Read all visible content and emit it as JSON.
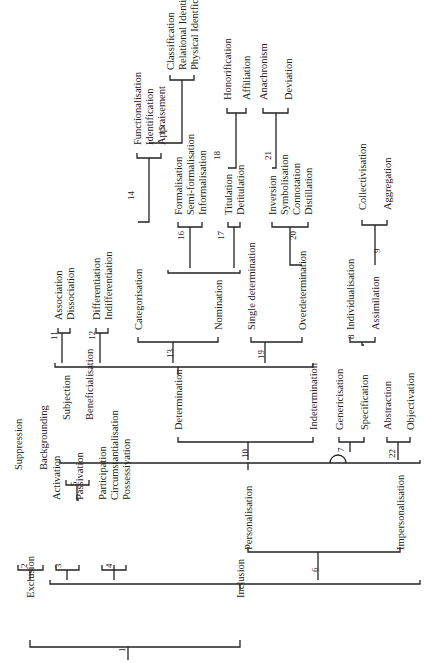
{
  "diagram": {
    "orientation": "rotated-90-ccw",
    "labels": [
      {
        "id": "exclusion",
        "text": "Exclusion",
        "x": 30,
        "y": 598
      },
      {
        "id": "inclusion",
        "text": "Inclusion",
        "x": 240,
        "y": 598
      },
      {
        "id": "suppression",
        "text": "Suppression",
        "x": 18,
        "y": 470
      },
      {
        "id": "backgrounding",
        "text": "Backgrounding",
        "x": 43,
        "y": 470
      },
      {
        "id": "activation",
        "text": "Activation",
        "x": 56,
        "y": 500
      },
      {
        "id": "passivation",
        "text": "Passivation",
        "x": 79,
        "y": 500
      },
      {
        "id": "subjection",
        "text": "Subjection",
        "x": 66,
        "y": 420
      },
      {
        "id": "beneficialisation",
        "text": "Beneficialisation",
        "x": 89,
        "y": 420
      },
      {
        "id": "participation",
        "text": "Participation",
        "x": 102,
        "y": 500
      },
      {
        "id": "circumstantialisation",
        "text": "Circumstantialisation",
        "x": 114,
        "y": 500
      },
      {
        "id": "possessivation",
        "text": "Possessivation",
        "x": 126,
        "y": 500
      },
      {
        "id": "personalisation",
        "text": "Personalisation",
        "x": 248,
        "y": 550
      },
      {
        "id": "impersonalisation",
        "text": "Impersonalisation",
        "x": 400,
        "y": 550
      },
      {
        "id": "determination",
        "text": "Determination",
        "x": 178,
        "y": 430
      },
      {
        "id": "indetermination",
        "text": "Indetermination",
        "x": 313,
        "y": 430
      },
      {
        "id": "genericisation",
        "text": "Genericisation",
        "x": 339,
        "y": 430
      },
      {
        "id": "specification",
        "text": "Specification",
        "x": 364,
        "y": 430
      },
      {
        "id": "abstraction",
        "text": "Abstraction",
        "x": 387,
        "y": 430
      },
      {
        "id": "objectivation",
        "text": "Objectivation",
        "x": 410,
        "y": 430
      },
      {
        "id": "association",
        "text": "Association",
        "x": 58,
        "y": 320
      },
      {
        "id": "dissociation",
        "text": "Dissociation",
        "x": 70,
        "y": 320
      },
      {
        "id": "differentiation",
        "text": "Differentiation",
        "x": 96,
        "y": 320
      },
      {
        "id": "indifferentiation",
        "text": "Indifferentiation",
        "x": 108,
        "y": 320
      },
      {
        "id": "categorisation",
        "text": "Categorisation",
        "x": 138,
        "y": 330
      },
      {
        "id": "nomination",
        "text": "Nomination",
        "x": 218,
        "y": 330
      },
      {
        "id": "single-determination",
        "text": "Single determination",
        "x": 251,
        "y": 330
      },
      {
        "id": "overdetermination",
        "text": "Overdetermination",
        "x": 302,
        "y": 330
      },
      {
        "id": "functionalisation",
        "text": "Functionalisation",
        "x": 137,
        "y": 145
      },
      {
        "id": "identification",
        "text": "Identification",
        "x": 149,
        "y": 145
      },
      {
        "id": "appraisement",
        "text": "Appraisement",
        "x": 161,
        "y": 145
      },
      {
        "id": "classification",
        "text": "Classification",
        "x": 170,
        "y": 70
      },
      {
        "id": "relational-identification",
        "text": "Relational Identification",
        "x": 182,
        "y": 70
      },
      {
        "id": "physical-identification",
        "text": "Physical Identfication",
        "x": 194,
        "y": 70
      },
      {
        "id": "formalisation",
        "text": "Formalisation",
        "x": 178,
        "y": 215
      },
      {
        "id": "semi-formalisation",
        "text": "Semi-formalisation",
        "x": 190,
        "y": 215
      },
      {
        "id": "informalisation",
        "text": "Informalisation",
        "x": 202,
        "y": 215
      },
      {
        "id": "titulation",
        "text": "Titulation",
        "x": 228,
        "y": 215
      },
      {
        "id": "detitulation",
        "text": "Detitulation",
        "x": 240,
        "y": 215
      },
      {
        "id": "honorification",
        "text": "Honorification",
        "x": 227,
        "y": 100
      },
      {
        "id": "affiliation",
        "text": "Affiliation",
        "x": 246,
        "y": 100
      },
      {
        "id": "inversion",
        "text": "Inversion",
        "x": 272,
        "y": 215
      },
      {
        "id": "symbolisation",
        "text": "Symbolisation",
        "x": 284,
        "y": 215
      },
      {
        "id": "connotation",
        "text": "Connotation",
        "x": 296,
        "y": 215
      },
      {
        "id": "distillation",
        "text": "Distillation",
        "x": 308,
        "y": 215
      },
      {
        "id": "anachronism",
        "text": "Anachronism",
        "x": 263,
        "y": 100
      },
      {
        "id": "deviation",
        "text": "Deviation",
        "x": 288,
        "y": 100
      },
      {
        "id": "individualisation",
        "text": "Individualisation",
        "x": 350,
        "y": 330
      },
      {
        "id": "assimilation",
        "text": "Assimilation",
        "x": 375,
        "y": 330
      },
      {
        "id": "collectivisation",
        "text": "Collectivisation",
        "x": 362,
        "y": 210
      },
      {
        "id": "aggregation",
        "text": "Aggregation",
        "x": 387,
        "y": 210
      }
    ],
    "numbers": [
      {
        "text": "1",
        "x": 125,
        "y": 652
      },
      {
        "text": "2",
        "x": 27,
        "y": 568
      },
      {
        "text": "3",
        "x": 61,
        "y": 568
      },
      {
        "text": "4",
        "x": 112,
        "y": 568
      },
      {
        "text": "5",
        "x": 77,
        "y": 486
      },
      {
        "text": "6",
        "x": 318,
        "y": 572
      },
      {
        "text": "7",
        "x": 344,
        "y": 452
      },
      {
        "text": "8",
        "x": 354,
        "y": 339
      },
      {
        "text": "9",
        "x": 380,
        "y": 253
      },
      {
        "text": "10",
        "x": 248,
        "y": 458
      },
      {
        "text": "11",
        "x": 57,
        "y": 340
      },
      {
        "text": "12",
        "x": 95,
        "y": 340
      },
      {
        "text": "13",
        "x": 173,
        "y": 358
      },
      {
        "text": "14",
        "x": 134,
        "y": 200
      },
      {
        "text": "15",
        "x": 165,
        "y": 135
      },
      {
        "text": "16",
        "x": 184,
        "y": 240
      },
      {
        "text": "17",
        "x": 224,
        "y": 240
      },
      {
        "text": "18",
        "x": 220,
        "y": 160
      },
      {
        "text": "19",
        "x": 264,
        "y": 359
      },
      {
        "text": "20",
        "x": 296,
        "y": 240
      },
      {
        "text": "21",
        "x": 271,
        "y": 160
      },
      {
        "text": "22",
        "x": 395,
        "y": 458
      }
    ]
  }
}
